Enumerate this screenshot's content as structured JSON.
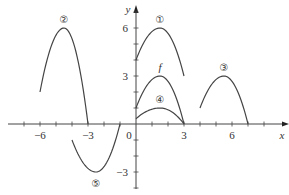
{
  "chart_data": {
    "type": "line",
    "title": "",
    "xlabel": "x",
    "ylabel": "y",
    "xlim": [
      -7.5,
      8
    ],
    "ylim": [
      -4,
      7.5
    ],
    "grid": false,
    "x_ticks": [
      -6,
      -3,
      0,
      3,
      6
    ],
    "x_tick_labels": [
      "−6",
      "−3",
      "0",
      "3",
      "6"
    ],
    "y_ticks": [
      -3,
      3,
      6
    ],
    "y_tick_labels": [
      "−3",
      "3",
      "6"
    ],
    "series": [
      {
        "name": "f",
        "label": "f",
        "x": [
          0,
          1.5,
          3
        ],
        "y": [
          1,
          3,
          0
        ],
        "peak": [
          1.5,
          3
        ]
      },
      {
        "name": "1",
        "label": "①",
        "x": [
          0,
          1.5,
          3
        ],
        "y": [
          4,
          6,
          3
        ],
        "peak": [
          1.5,
          6
        ]
      },
      {
        "name": "2",
        "label": "②",
        "x": [
          -6,
          -4.5,
          -3
        ],
        "y": [
          2,
          6,
          0
        ],
        "peak": [
          -4.5,
          6
        ]
      },
      {
        "name": "3",
        "label": "③",
        "x": [
          4,
          5.5,
          7
        ],
        "y": [
          1,
          3,
          0
        ],
        "peak": [
          5.5,
          3
        ]
      },
      {
        "name": "4",
        "label": "④",
        "x": [
          0,
          1.5,
          3
        ],
        "y": [
          0.33,
          1,
          0
        ],
        "peak": [
          1.5,
          1
        ]
      },
      {
        "name": "5",
        "label": "⑤",
        "x": [
          -4,
          -2.5,
          -1
        ],
        "y": [
          -1,
          -3,
          0
        ],
        "peak": [
          -2.5,
          -3
        ]
      }
    ]
  }
}
